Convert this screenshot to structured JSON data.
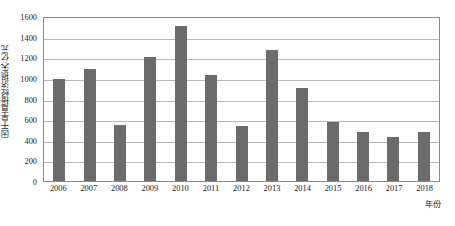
{
  "chart_data": {
    "type": "bar",
    "title": "",
    "xlabel": "年份",
    "ylabel": "因干旱直接经济损失/亿元",
    "categories": [
      "2006",
      "2007",
      "2008",
      "2009",
      "2010",
      "2011",
      "2012",
      "2013",
      "2014",
      "2015",
      "2016",
      "2017",
      "2018"
    ],
    "values": [
      985,
      1090,
      545,
      1205,
      1505,
      1025,
      530,
      1270,
      905,
      575,
      480,
      430,
      480
    ],
    "ylim": [
      0,
      1600
    ],
    "y_ticks": [
      "0",
      "200",
      "400",
      "600",
      "800",
      "1000",
      "1200",
      "1400",
      "1600"
    ],
    "y_tick_values": [
      0,
      200,
      400,
      600,
      800,
      1000,
      1200,
      1400,
      1600
    ],
    "grid": true,
    "legend": "none",
    "bar_color": "#6b6b6b",
    "grid_color": "#b9b9b9",
    "axis_color": "#8a8a8a",
    "background": "#ffffff"
  }
}
